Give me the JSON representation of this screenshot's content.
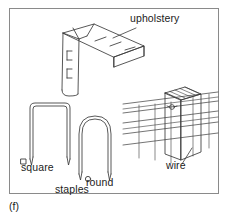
{
  "figure": {
    "caption": "(f)",
    "frame_color": "#8a8a8a",
    "line_color": "#3a3a3a",
    "text_color": "#1b1b1b",
    "background_color": "#ffffff"
  },
  "labels": {
    "upholstery": "upholstery",
    "square": "square",
    "round": "round",
    "staples": "staples",
    "wire": "wire"
  },
  "items": [
    {
      "id": "upholstery-staple",
      "label": "upholstery",
      "description": "L-shaped flat-crown upholstery staple shown in isometric view with long crown bar and one descending leg"
    },
    {
      "id": "square-staple",
      "label": "square",
      "description": "Square-crown staple with flat top, rounded corners and two straight pointed legs",
      "cross_section": "square"
    },
    {
      "id": "round-staple",
      "label": "round",
      "description": "Round-crown staple with arched top and two straight pointed legs",
      "cross_section": "round"
    },
    {
      "id": "wire-fence-post",
      "label": "wire",
      "description": "Fence post in isometric view with five horizontal fence wires fastened by staples"
    }
  ],
  "group_label": "staples"
}
